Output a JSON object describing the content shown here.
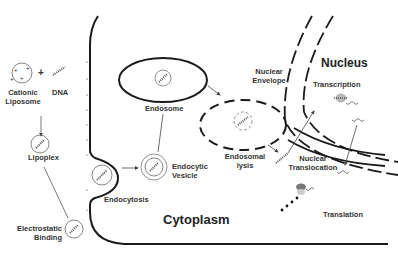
{
  "diagram": {
    "colors": {
      "stroke": "#1a1a1a",
      "vesicle": "#555555",
      "protein": "#aaaaaa",
      "ribosome": "#888888"
    },
    "regions": {
      "cytoplasm": "Cytoplasm",
      "nucleus": "Nucleus"
    },
    "labels": {
      "cationic_liposome_line1": "Cationic",
      "cationic_liposome_line2": "Liposome",
      "plus": "+",
      "dna": "DNA",
      "lipoplex": "Lipoplex",
      "electrostatic_line1": "Electrostatic",
      "electrostatic_line2": "Binding",
      "endocytosis": "Endocytosis",
      "endocytic_line1": "Endocytic",
      "endocytic_line2": "Vesicle",
      "endosome": "Endosome",
      "endosomal_line1": "Endosomal",
      "endosomal_line2": "lysis",
      "nuclear_envelope_line1": "Nuclear",
      "nuclear_envelope_line2": "Envelope",
      "nuclear_translocation_line1": "Nuclear",
      "nuclear_translocation_line2": "Translocation",
      "transcription": "Transcription",
      "translation": "Translation"
    }
  }
}
